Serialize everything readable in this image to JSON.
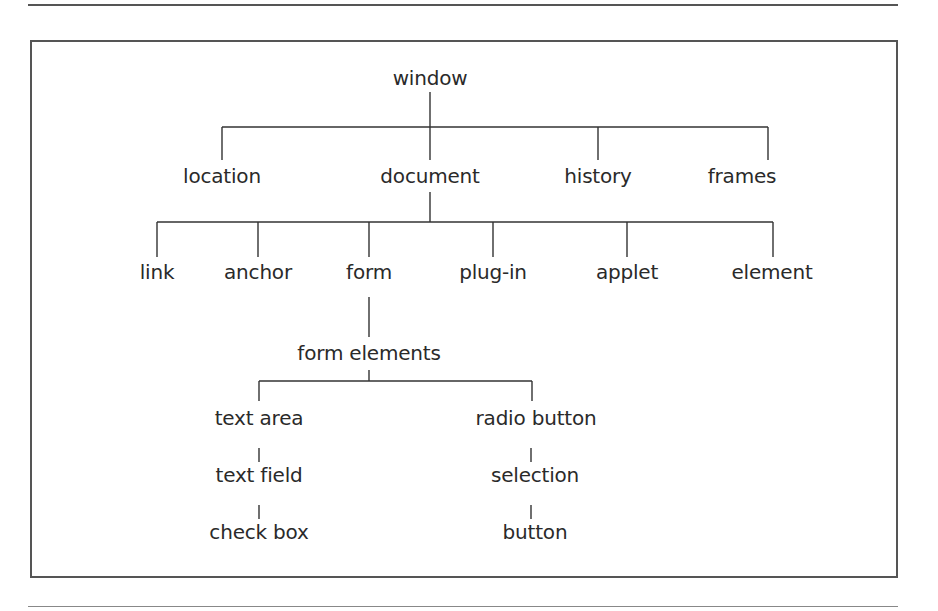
{
  "diagram": {
    "type": "tree",
    "root": {
      "label": "window",
      "children": [
        {
          "label": "location"
        },
        {
          "label": "document",
          "children": [
            {
              "label": "link"
            },
            {
              "label": "anchor"
            },
            {
              "label": "form",
              "children": [
                {
                  "label": "form elements",
                  "children": [
                    {
                      "label": "text area"
                    },
                    {
                      "label": "text field"
                    },
                    {
                      "label": "check box"
                    },
                    {
                      "label": "radio button"
                    },
                    {
                      "label": "selection"
                    },
                    {
                      "label": "button"
                    }
                  ]
                }
              ]
            },
            {
              "label": "plug-in"
            },
            {
              "label": "applet"
            },
            {
              "label": "element"
            }
          ]
        },
        {
          "label": "history"
        },
        {
          "label": "frames"
        }
      ]
    },
    "nodes": {
      "window": "window",
      "location": "location",
      "document": "document",
      "history": "history",
      "frames": "frames",
      "link": "link",
      "anchor": "anchor",
      "form": "form",
      "plugin": "plug-in",
      "applet": "applet",
      "element": "element",
      "form_elements": "form elements",
      "text_area": "text area",
      "text_field": "text field",
      "check_box": "check box",
      "radio_button": "radio button",
      "selection": "selection",
      "button": "button"
    },
    "colors": {
      "line": "#333333",
      "text": "#2a2a2a",
      "frame": "#555555",
      "background": "#ffffff"
    }
  }
}
